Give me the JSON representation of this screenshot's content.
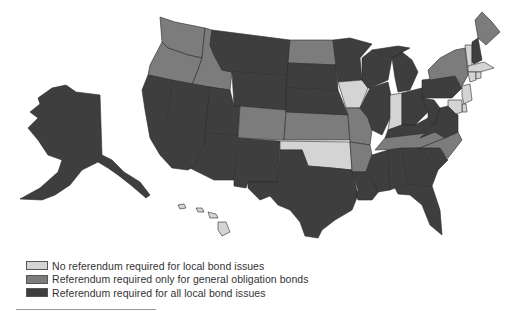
{
  "categories": {
    "none": {
      "label": "No referendum required for local bond issues",
      "color": "#d4d4d4"
    },
    "go": {
      "label": "Referendum required only for general obligation bonds",
      "color": "#7c7c7c"
    },
    "all": {
      "label": "Referendum required for all local bond issues",
      "color": "#3e3e3e"
    }
  },
  "legend": [
    {
      "key": "none",
      "label": "No referendum required for local bond issues"
    },
    {
      "key": "go",
      "label": "Referendum required only for general obligation bonds"
    },
    {
      "key": "all",
      "label": "Referendum required for all local bond issues"
    }
  ],
  "states": {
    "AK": "all",
    "HI": "none",
    "WA": "go",
    "OR": "go",
    "ID": "go",
    "CA": "all",
    "NV": "all",
    "MT": "all",
    "WY": "all",
    "UT": "all",
    "AZ": "all",
    "CO": "go",
    "NM": "all",
    "ND": "go",
    "SD": "all",
    "NE": "all",
    "KS": "go",
    "OK": "none",
    "TX": "all",
    "MN": "all",
    "IA": "none",
    "MO": "go",
    "AR": "go",
    "LA": "all",
    "WI": "all",
    "IL": "all",
    "MI": "all",
    "IN": "none",
    "OH": "all",
    "KY": "all",
    "TN": "go",
    "MS": "all",
    "AL": "all",
    "GA": "all",
    "FL": "all",
    "SC": "all",
    "NC": "go",
    "VA": "all",
    "WV": "all",
    "PA": "all",
    "NY": "go",
    "VT": "none",
    "NH": "all",
    "ME": "go",
    "MA": "none",
    "CT": "none",
    "RI": "none",
    "NJ": "none",
    "DE": "none",
    "MD": "none"
  }
}
